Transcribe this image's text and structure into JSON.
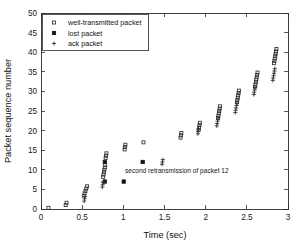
{
  "chart_data": {
    "type": "scatter",
    "title": "",
    "xlabel": "Time (sec)",
    "ylabel": "Packet sequence number",
    "xlim": [
      0,
      3
    ],
    "ylim": [
      0,
      50
    ],
    "xticks": [
      0,
      0.5,
      1,
      1.5,
      2,
      2.5,
      3
    ],
    "xticklabels": [
      "0",
      "0.5",
      "1",
      "1.5",
      "2",
      "2.5",
      "3"
    ],
    "yticks": [
      0,
      5,
      10,
      15,
      20,
      25,
      30,
      35,
      40,
      45,
      50
    ],
    "yticklabels": [
      "0",
      "5",
      "10",
      "15",
      "20",
      "25",
      "30",
      "35",
      "40",
      "45",
      "50"
    ],
    "grid": false,
    "legend_position": "upper-left",
    "annotations": [
      {
        "text": "second retransmission of packet 12",
        "x": 1.02,
        "y": 9.3
      }
    ],
    "series": [
      {
        "name": "well-transmitted packet",
        "marker": "open-square",
        "color": "#2f2f2f",
        "points": [
          [
            0.09,
            0.3
          ],
          [
            0.3,
            1.0
          ],
          [
            0.31,
            1.6
          ],
          [
            0.52,
            3.4
          ],
          [
            0.53,
            4.0
          ],
          [
            0.54,
            4.6
          ],
          [
            0.55,
            5.2
          ],
          [
            0.56,
            5.8
          ],
          [
            0.755,
            8.2
          ],
          [
            0.76,
            8.8
          ],
          [
            0.765,
            9.4
          ],
          [
            0.77,
            10.0
          ],
          [
            0.775,
            10.6
          ],
          [
            0.78,
            11.2
          ],
          [
            0.785,
            13.0
          ],
          [
            0.79,
            13.6
          ],
          [
            0.795,
            14.2
          ],
          [
            1.015,
            15.2
          ],
          [
            1.02,
            15.8
          ],
          [
            1.025,
            16.4
          ],
          [
            1.245,
            17.0
          ],
          [
            1.695,
            18.2
          ],
          [
            1.7,
            18.8
          ],
          [
            1.705,
            19.4
          ],
          [
            1.915,
            20.2
          ],
          [
            1.92,
            20.8
          ],
          [
            1.925,
            21.4
          ],
          [
            1.93,
            22.0
          ],
          [
            2.15,
            23.2
          ],
          [
            2.155,
            23.8
          ],
          [
            2.16,
            24.4
          ],
          [
            2.165,
            25.0
          ],
          [
            2.17,
            25.6
          ],
          [
            2.175,
            26.2
          ],
          [
            2.38,
            27.2
          ],
          [
            2.385,
            27.8
          ],
          [
            2.39,
            28.4
          ],
          [
            2.395,
            29.0
          ],
          [
            2.4,
            29.6
          ],
          [
            2.405,
            30.2
          ],
          [
            2.6,
            31.2
          ],
          [
            2.605,
            31.8
          ],
          [
            2.61,
            32.4
          ],
          [
            2.615,
            33.0
          ],
          [
            2.62,
            33.6
          ],
          [
            2.625,
            34.2
          ],
          [
            2.63,
            34.8
          ],
          [
            2.83,
            37.2
          ],
          [
            2.835,
            37.8
          ],
          [
            2.84,
            38.4
          ],
          [
            2.845,
            39.0
          ],
          [
            2.85,
            39.6
          ],
          [
            2.855,
            40.2
          ],
          [
            2.86,
            40.8
          ]
        ]
      },
      {
        "name": "lost packet",
        "marker": "filled-square",
        "color": "#121212",
        "points": [
          [
            0.775,
            12.0
          ],
          [
            0.775,
            7.0
          ],
          [
            1.235,
            12.0
          ],
          [
            1.005,
            7.0
          ]
        ]
      },
      {
        "name": "ack packet",
        "marker": "plus",
        "color": "#2f2f2f",
        "points": [
          [
            0.525,
            2.0
          ],
          [
            0.53,
            2.6
          ],
          [
            0.535,
            3.2
          ],
          [
            0.745,
            5.6
          ],
          [
            0.75,
            6.2
          ],
          [
            0.755,
            6.8
          ],
          [
            0.76,
            7.0
          ],
          [
            1.47,
            11.4
          ],
          [
            1.475,
            12.0
          ],
          [
            1.48,
            12.6
          ],
          [
            1.905,
            19.2
          ],
          [
            1.91,
            19.8
          ],
          [
            1.915,
            20.4
          ],
          [
            2.135,
            21.2
          ],
          [
            2.14,
            21.8
          ],
          [
            2.145,
            22.4
          ],
          [
            2.15,
            23.0
          ],
          [
            2.36,
            24.6
          ],
          [
            2.365,
            25.2
          ],
          [
            2.37,
            25.8
          ],
          [
            2.375,
            26.4
          ],
          [
            2.38,
            27.0
          ],
          [
            2.585,
            29.2
          ],
          [
            2.59,
            29.8
          ],
          [
            2.595,
            30.4
          ],
          [
            2.6,
            31.0
          ],
          [
            2.815,
            32.8
          ],
          [
            2.82,
            33.4
          ],
          [
            2.825,
            34.0
          ],
          [
            2.83,
            34.6
          ],
          [
            2.835,
            35.2
          ],
          [
            2.84,
            35.8
          ]
        ]
      }
    ]
  },
  "legend": {
    "entries": [
      {
        "label": "well-transmitted packet",
        "marker": "open-square"
      },
      {
        "label": "lost packet",
        "marker": "filled-square"
      },
      {
        "label": "ack packet",
        "marker": "plus"
      }
    ]
  }
}
